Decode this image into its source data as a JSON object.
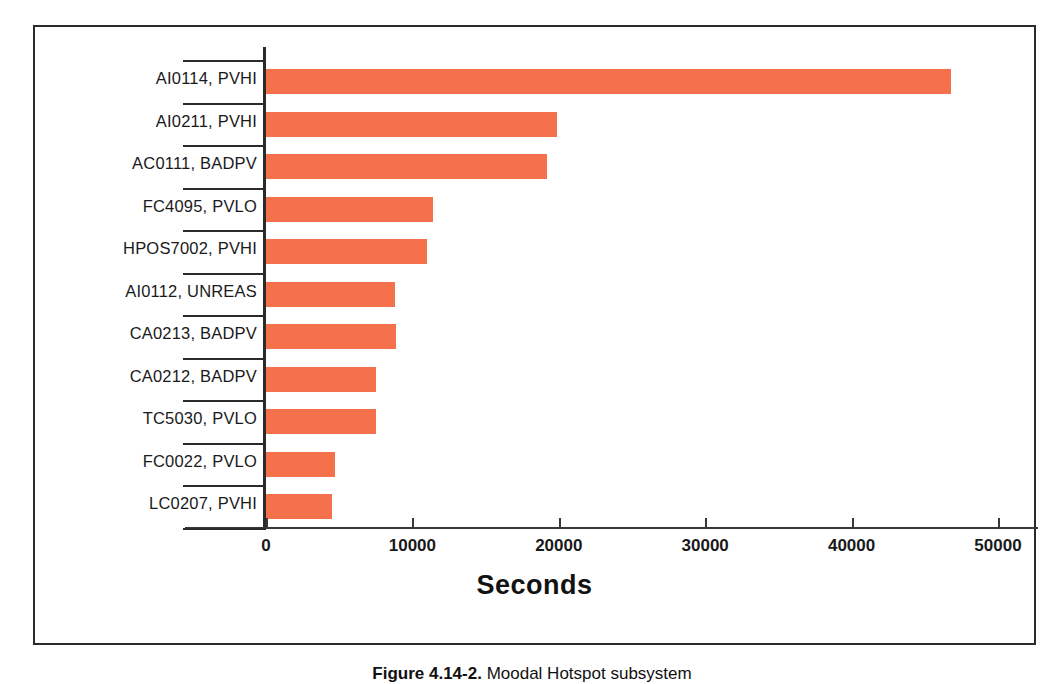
{
  "chart_data": {
    "type": "bar",
    "orientation": "horizontal",
    "title": "",
    "xlabel": "Seconds",
    "ylabel": "",
    "xlim": [
      0,
      50000
    ],
    "xticks": [
      0,
      10000,
      20000,
      30000,
      40000,
      50000
    ],
    "xtick_labels": [
      "0",
      "10000",
      "20000",
      "30000",
      "40000",
      "50000"
    ],
    "grid": false,
    "legend": false,
    "bar_color": "#f4714c",
    "categories": [
      "AI0114, PVHI",
      "AI0211, PVHI",
      "AC0111, BADPV",
      "FC4095, PVLO",
      "HPOS7002, PVHI",
      "AI0112, UNREAS",
      "CA0213, BADPV",
      "CA0212, BADPV",
      "TC5030, PVLO",
      "FC0022, PVLO",
      "LC0207, PVHI"
    ],
    "values": [
      46800,
      19900,
      19200,
      11400,
      11000,
      8800,
      8850,
      7500,
      7500,
      4700,
      4500
    ]
  },
  "axis": {
    "x_title": "Seconds"
  },
  "caption": {
    "label": "Figure 4.14-2.",
    "text": "Moodal Hotspot subsystem"
  }
}
